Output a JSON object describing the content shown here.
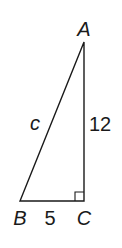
{
  "diagram": {
    "type": "right-triangle",
    "vertices": {
      "A": {
        "label": "A",
        "x": 84,
        "y": 42
      },
      "B": {
        "label": "B",
        "x": 20,
        "y": 201
      },
      "C": {
        "label": "C",
        "x": 84,
        "y": 201
      }
    },
    "sides": {
      "hypotenuse": {
        "label": "c",
        "from": "B",
        "to": "A"
      },
      "vertical_leg": {
        "label": "12",
        "from": "C",
        "to": "A"
      },
      "base": {
        "label": "5",
        "from": "B",
        "to": "C"
      }
    },
    "right_angle_at": "C",
    "colors": {
      "stroke": "#1a1a1a",
      "background": "#ffffff"
    }
  }
}
